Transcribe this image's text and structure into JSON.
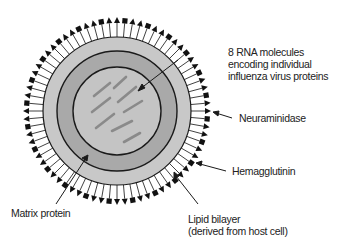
{
  "diagram": {
    "colors": {
      "envelope": "#c8c8c8",
      "matrix_ring": "#a9a9a9",
      "core": "#c4c4c4",
      "rna": "#8a8a8a",
      "outline": "#1a1a1a",
      "spike": "#111111"
    },
    "rna_segment_count": 8,
    "labels": {
      "rna": [
        "8 RNA molecules",
        "encoding individual",
        "influenza virus proteins"
      ],
      "neuraminidase": "Neuraminidase",
      "hemagglutinin": "Hemagglutinin",
      "matrix": "Matrix protein",
      "lipid": [
        "Lipid bilayer",
        "(derived from host cell)"
      ]
    }
  }
}
